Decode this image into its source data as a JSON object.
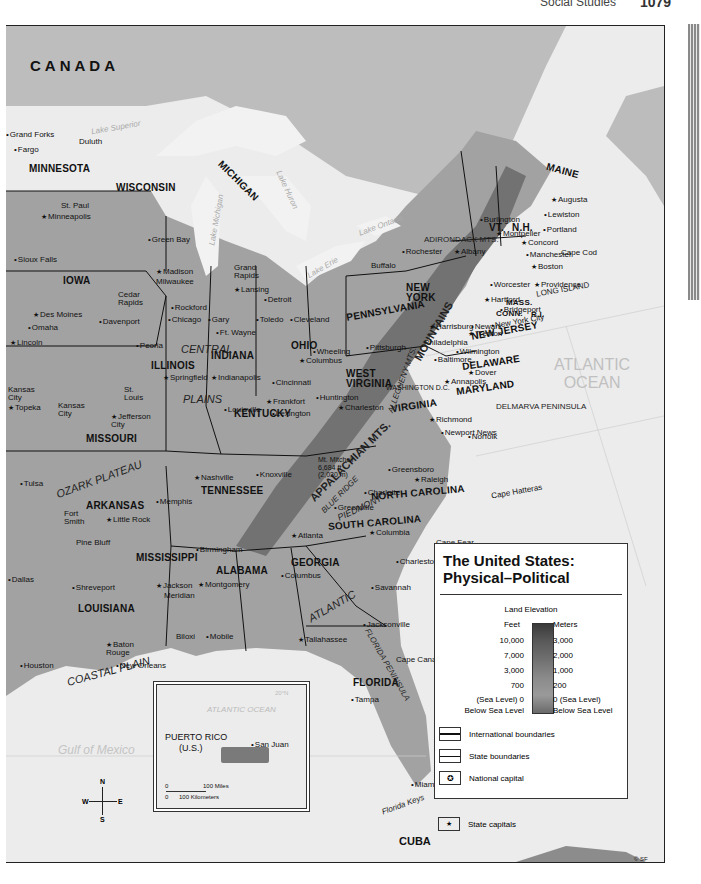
{
  "page": {
    "subject": "Social Studies",
    "page_number": "1079"
  },
  "map": {
    "title_line1": "The United States:",
    "title_line2": "Physical–Political",
    "copyright": "© SF",
    "countries": [
      "CANADA",
      "CUBA"
    ],
    "oceans": {
      "atlantic_line1": "ATLANTIC",
      "atlantic_line2": "OCEAN",
      "gulf": "Gulf of Mexico"
    },
    "lakes": [
      "Lake Superior",
      "Lake Michigan",
      "Lake Huron",
      "Lake Erie",
      "Lake Ontario"
    ],
    "states": [
      "MINNESOTA",
      "WISCONSIN",
      "MICHIGAN",
      "IOWA",
      "ILLINOIS",
      "INDIANA",
      "OHIO",
      "PENNSYLVANIA",
      "NEW YORK",
      "MAINE",
      "VT.",
      "N.H.",
      "MASS.",
      "CONN.",
      "R.I.",
      "NEW JERSEY",
      "DELAWARE",
      "MARYLAND",
      "WEST VIRGINIA",
      "VIRGINIA",
      "KENTUCKY",
      "MISSOURI",
      "ARKANSAS",
      "TENNESSEE",
      "NORTH CAROLINA",
      "SOUTH CAROLINA",
      "MISSISSIPPI",
      "ALABAMA",
      "GEORGIA",
      "LOUISIANA",
      "FLORIDA"
    ],
    "regions": [
      "CENTRAL",
      "PLAINS",
      "OZARK PLATEAU",
      "APPALACHIAN MTS.",
      "ALLEGHENY MTS.",
      "MOUNTAINS",
      "ADIRONDACK MTS.",
      "BLUE RIDGE",
      "PIEDMONT",
      "COASTAL PLAIN",
      "ATLANTIC",
      "FLORIDA PENINSULA",
      "DELMARVA PENINSULA",
      "LONG ISLAND",
      "Mississippi Delta",
      "Florida Keys",
      "Chesapeake Bay",
      "Straits of Florida"
    ],
    "capes": [
      "Cape Cod",
      "Cape Hatteras",
      "Cape Fear",
      "Cape Canaveral"
    ],
    "mountain_peak": {
      "name": "Mt. Mitchell",
      "feet": "6,684 ft",
      "meters": "(2,030 m)"
    },
    "gridlines": [
      "40°N",
      "35° North Latitude",
      "70° West Longitude",
      "20°N",
      "Tropic of Cancer"
    ],
    "cities": {
      "grand_forks": "Grand Forks",
      "fargo": "Fargo",
      "duluth": "Duluth",
      "st_paul": "St. Paul",
      "minneapolis": "Minneapolis",
      "sioux_falls": "Sioux Falls",
      "green_bay": "Green Bay",
      "madison": "Madison",
      "milwaukee": "Milwaukee",
      "grand_rapids": "Grand Rapids",
      "lansing": "Lansing",
      "detroit": "Detroit",
      "cedar_rapids": "Cedar Rapids",
      "des_moines": "Des Moines",
      "davenport": "Davenport",
      "omaha": "Omaha",
      "lincoln": "Lincoln",
      "rockford": "Rockford",
      "chicago": "Chicago",
      "gary": "Gary",
      "ft_wayne": "Ft. Wayne",
      "toledo": "Toledo",
      "cleveland": "Cleveland",
      "peoria": "Peoria",
      "springfield": "Springfield",
      "indianapolis": "Indianapolis",
      "columbus_oh": "Columbus",
      "wheeling": "Wheeling",
      "cincinnati": "Cincinnati",
      "kansas_city_ks": "Kansas City",
      "kansas_city_mo": "Kansas City",
      "topeka": "Topeka",
      "st_louis": "St. Louis",
      "jefferson_city": "Jefferson City",
      "louisville": "Louisville",
      "frankfort": "Frankfort",
      "lexington": "Lexington",
      "huntington": "Huntington",
      "charleston_wv": "Charleston",
      "pittsburgh": "Pittsburgh",
      "harrisburg": "Harrisburg",
      "philadelphia": "Philadelphia",
      "buffalo": "Buffalo",
      "rochester": "Rochester",
      "albany": "Albany",
      "burlington": "Burlington",
      "montpelier": "Montpelier",
      "augusta": "Augusta",
      "lewiston": "Lewiston",
      "portland": "Portland",
      "concord": "Concord",
      "manchester": "Manchester",
      "boston": "Boston",
      "worcester": "Worcester",
      "providence": "Providence",
      "hartford": "Hartford",
      "bridgeport": "Bridgeport",
      "new_york_city": "New York City",
      "jersey_city": "Jersey City",
      "newark": "Newark",
      "trenton": "Trenton",
      "wilmington": "Wilmington",
      "baltimore": "Baltimore",
      "dover": "Dover",
      "annapolis": "Annapolis",
      "washington": "WASHINGTON D.C.",
      "richmond": "Richmond",
      "newport_news": "Newport News",
      "norfolk": "Norfolk",
      "greensboro": "Greensboro",
      "raleigh": "Raleigh",
      "charlotte": "Charlotte",
      "greenville": "Greenville",
      "columbia": "Columbia",
      "charleston_sc": "Charleston",
      "savannah": "Savannah",
      "atlanta": "Atlanta",
      "columbus_ga": "Columbus",
      "jacksonville": "Jacksonville",
      "tallahassee": "Tallahassee",
      "tampa": "Tampa",
      "miami": "Miami",
      "tulsa": "Tulsa",
      "fort_smith": "Fort Smith",
      "little_rock": "Little Rock",
      "pine_bluff": "Pine Bluff",
      "memphis": "Memphis",
      "nashville": "Nashville",
      "knoxville": "Knoxville",
      "birmingham": "Birmingham",
      "montgomery": "Montgomery",
      "jackson": "Jackson",
      "meridian": "Meridian",
      "mobile": "Mobile",
      "biloxi": "Biloxi",
      "dallas": "Dallas",
      "shreveport": "Shreveport",
      "baton_rouge": "Baton Rouge",
      "new_orleans": "New Orleans",
      "houston": "Houston"
    }
  },
  "scale": {
    "miles": [
      "0",
      "100",
      "200 Miles"
    ],
    "km": [
      "0",
      "100",
      "200",
      "Kilometers"
    ]
  },
  "legend": {
    "section_title": "Land Elevation",
    "feet_header": "Feet",
    "meters_header": "Meters",
    "rows": [
      {
        "feet": "10,000",
        "meters": "3,000"
      },
      {
        "feet": "7,000",
        "meters": "2,000"
      },
      {
        "feet": "3,000",
        "meters": "1,000"
      },
      {
        "feet": "700",
        "meters": "200"
      },
      {
        "feet": "(Sea Level) 0",
        "meters": "0 (Sea Level)"
      },
      {
        "feet": "Below Sea Level",
        "meters": "Below Sea Level"
      }
    ],
    "symbols": [
      {
        "icon": "international-boundary-line",
        "label": "International boundaries"
      },
      {
        "icon": "state-boundary-line",
        "label": "State boundaries"
      },
      {
        "icon": "national-capital-star-circle",
        "label": "National capital"
      },
      {
        "icon": "state-capital-star",
        "label": "State capitals"
      }
    ]
  },
  "inset": {
    "ocean": "ATLANTIC OCEAN",
    "name_line1": "PUERTO RICO",
    "name_line2": "(U.S.)",
    "city": "San Juan",
    "latitude": "20°N",
    "scale_miles": [
      "0",
      "100  Miles"
    ],
    "scale_km": [
      "0",
      "100 Kilometers"
    ]
  },
  "compass": {
    "n": "N",
    "s": "S",
    "e": "E",
    "w": "W"
  },
  "colors": {
    "water": "#ececec",
    "land_us": "#9a9a9a",
    "land_foreign": "#bdbdbd",
    "mountains": "#6a6a6a",
    "border": "#111111"
  }
}
